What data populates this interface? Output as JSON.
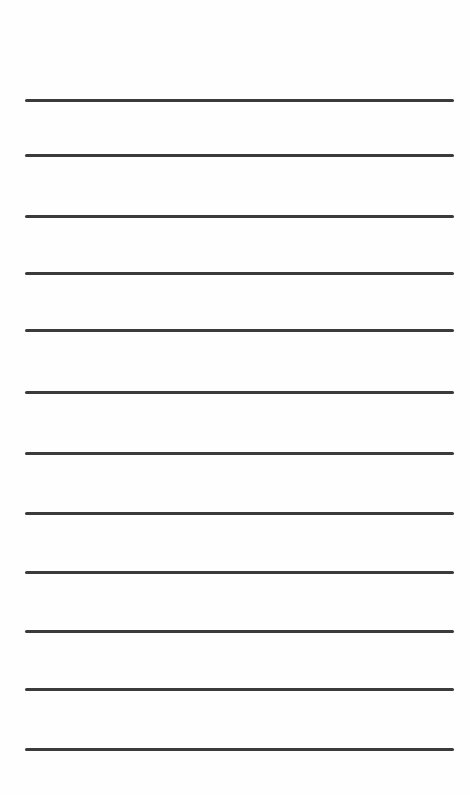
{
  "page": {
    "background": "#fefefe",
    "line_color": "#3b3b3b",
    "line_count": 12,
    "lines": [
      {
        "y": 100
      },
      {
        "y": 155
      },
      {
        "y": 216
      },
      {
        "y": 273
      },
      {
        "y": 330
      },
      {
        "y": 392
      },
      {
        "y": 453
      },
      {
        "y": 513
      },
      {
        "y": 572
      },
      {
        "y": 631
      },
      {
        "y": 689
      },
      {
        "y": 749
      }
    ]
  }
}
